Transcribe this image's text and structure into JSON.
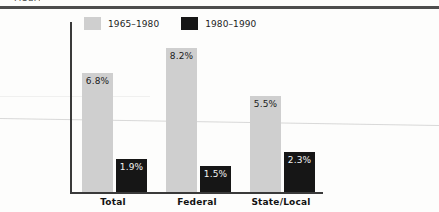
{
  "page": {
    "caption_remnant": "Figure",
    "rule_color": "#4d4d4d"
  },
  "chart_data": {
    "type": "bar",
    "title": "",
    "subtitle": "",
    "xlabel": "",
    "ylabel": "",
    "categories": [
      "Total",
      "Federal",
      "State/Local"
    ],
    "series": [
      {
        "name": "1965–1980",
        "color": "#cfcfcf",
        "values": [
          6.8,
          8.2,
          5.5
        ],
        "labels": [
          "6.8%",
          "8.2%",
          "5.5%"
        ]
      },
      {
        "name": "1980–1990",
        "color": "#161616",
        "values": [
          1.9,
          1.5,
          2.3
        ],
        "labels": [
          "1.9%",
          "1.5%",
          "2.3%"
        ]
      }
    ],
    "ylim": [
      0,
      9.7
    ],
    "grid": false,
    "legend_position": "top-left",
    "axis_color": "#3a3a3a",
    "value_label_position": "inside-top"
  }
}
